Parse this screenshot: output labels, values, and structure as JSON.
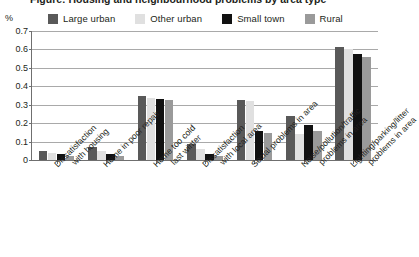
{
  "title": "Figure: Housing and neighbourhood problems by area type",
  "y_unit": "%",
  "legend": [
    {
      "label": "Large urban",
      "color": "#595959"
    },
    {
      "label": "Other urban",
      "color": "#e0e0e0"
    },
    {
      "label": "Small town",
      "color": "#111111"
    },
    {
      "label": "Rural",
      "color": "#9a9a9a"
    }
  ],
  "y_ticks": [
    "0.7",
    "0.6",
    "0.5",
    "0.4",
    "0.3",
    "0.2",
    "0.1",
    "0"
  ],
  "chart_data": {
    "type": "bar",
    "title": "Figure: Housing and neighbourhood problems by area type",
    "xlabel": "",
    "ylabel": "%",
    "ylim": [
      0,
      0.7
    ],
    "grid": true,
    "legend_position": "top",
    "categories": [
      "Dissatisfaction with housing",
      "Home in poor repair",
      "Home too cold last winter",
      "Dissatisfaction with local area",
      "Social problems in area",
      "Noise/pollution/traffic problems in area",
      "Lighting/parking/litter problems in area"
    ],
    "categories_lines": [
      [
        "Dissatisfaction",
        "with housing"
      ],
      [
        "Home in poor repair",
        ""
      ],
      [
        "Home too cold",
        "last winter"
      ],
      [
        "Dissatisfaction",
        "with local area"
      ],
      [
        "Social problems in area",
        ""
      ],
      [
        "Noise/pollution/traffic",
        "problems in area"
      ],
      [
        "Lighting/parking/litter",
        "problems in area"
      ]
    ],
    "series": [
      {
        "name": "Large urban",
        "color": "#595959",
        "values": [
          0.05,
          0.07,
          0.35,
          0.085,
          0.325,
          0.24,
          0.615
        ]
      },
      {
        "name": "Other urban",
        "color": "#e0e0e0",
        "values": [
          0.04,
          0.05,
          0.335,
          0.06,
          0.32,
          0.14,
          0.6
        ]
      },
      {
        "name": "Small town",
        "color": "#111111",
        "values": [
          0.03,
          0.035,
          0.33,
          0.03,
          0.155,
          0.19,
          0.575
        ]
      },
      {
        "name": "Rural",
        "color": "#9a9a9a",
        "values": [
          0.022,
          0.02,
          0.325,
          0.022,
          0.145,
          0.155,
          0.56
        ]
      }
    ]
  }
}
